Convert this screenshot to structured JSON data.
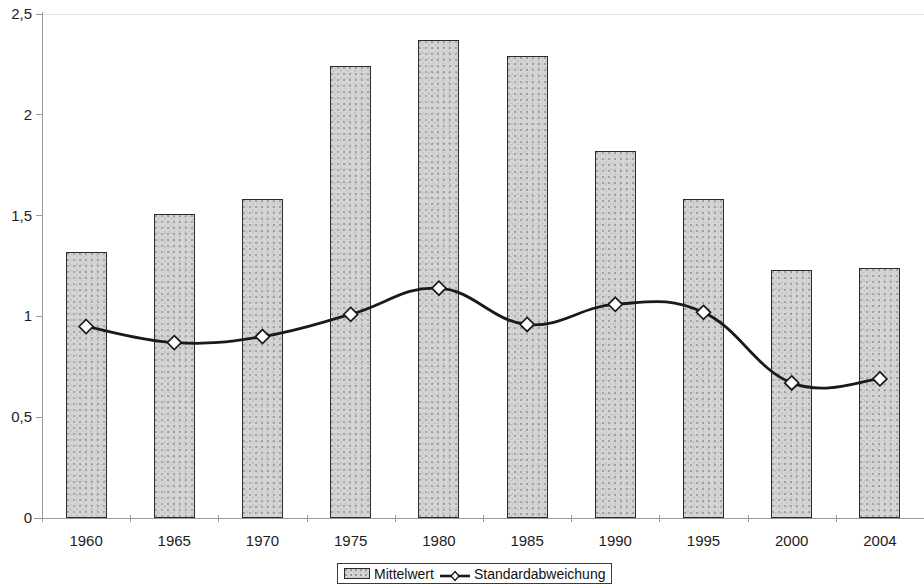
{
  "chart_data": {
    "type": "bar",
    "title": "",
    "subtitle": "",
    "xlabel": "",
    "ylabel": "",
    "categories": [
      "1960",
      "1965",
      "1970",
      "1975",
      "1980",
      "1985",
      "1990",
      "1995",
      "2000",
      "2004"
    ],
    "ylim": [
      0,
      2.5
    ],
    "yticks": [
      0,
      0.5,
      1,
      1.5,
      2,
      2.5
    ],
    "ytick_labels": [
      "0",
      "0,5",
      "1",
      "1,5",
      "2",
      "2,5"
    ],
    "grid": false,
    "legend_position": "bottom-center",
    "series": [
      {
        "name": "Mittelwert",
        "type": "bar",
        "values": [
          1.32,
          1.51,
          1.58,
          2.24,
          2.37,
          2.29,
          1.82,
          1.58,
          1.23,
          1.24
        ]
      },
      {
        "name": "Standardabweichung",
        "type": "line",
        "marker": "diamond",
        "values": [
          0.95,
          0.87,
          0.9,
          1.01,
          1.14,
          0.96,
          1.06,
          1.02,
          0.67,
          0.69
        ]
      }
    ],
    "colors": {
      "bar_fill": "#d4d4d4",
      "bar_stroke": "#2b2b2b",
      "line_stroke": "#1a1a1a",
      "marker_fill": "#ffffff",
      "axis": "#9a9a9a",
      "text": "#1d1d1d"
    }
  },
  "legend": {
    "items": [
      {
        "label": "Mittelwert",
        "icon": "bar-swatch-icon"
      },
      {
        "label": "Standardabweichung",
        "icon": "line-diamond-swatch-icon"
      }
    ]
  }
}
